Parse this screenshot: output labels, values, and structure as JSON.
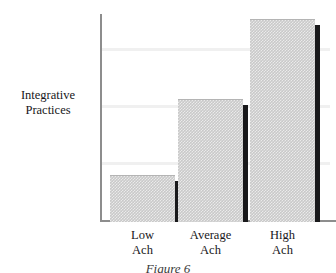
{
  "chart_data": {
    "type": "bar",
    "title": "",
    "xlabel": "",
    "ylabel": "Integrative Practices",
    "categories": [
      "Low Ach",
      "Average Ach",
      "High Ach"
    ],
    "category_lines": [
      [
        "Low",
        "Ach"
      ],
      [
        "Average",
        "Ach"
      ],
      [
        "High",
        "Ach"
      ]
    ],
    "values": [
      4.0,
      10.7,
      17.7
    ],
    "ylim": [
      0,
      18.2
    ],
    "yticks": [
      5,
      10,
      15
    ],
    "ytick_labels": [
      "5",
      "10",
      "15"
    ],
    "grid": true,
    "legend": "none",
    "series": [
      {
        "name": "Integrative Practices",
        "values": [
          4.0,
          10.7,
          17.7
        ]
      }
    ],
    "style": {
      "bar_fill": "#c9c9c9",
      "bar_shadow": "#19191b",
      "gridline_color": "#f0f0f0",
      "axis_color": "#8d8d8d",
      "text_color": "#17171a",
      "background": "#ffffff"
    }
  },
  "axis": {
    "y_title_line1": "Integrative",
    "y_title_line2": "Practices"
  },
  "caption": {
    "text": "Figure 6"
  }
}
